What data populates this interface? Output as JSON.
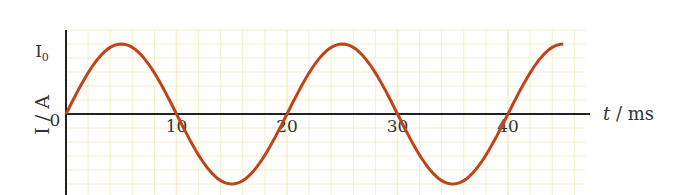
{
  "chart_data": {
    "type": "line",
    "title": "",
    "xlabel": "t / ms",
    "xlabel_italic_part": "t",
    "xlabel_unit_part": " / ms",
    "ylabel": "I / A",
    "x_ticks": [
      10,
      20,
      30,
      40
    ],
    "y_ticks": [
      {
        "value": 0,
        "label": "0"
      },
      {
        "value": 1,
        "label": "I",
        "subscript": "0"
      }
    ],
    "xlim": [
      0,
      47
    ],
    "ylim": [
      -1.05,
      1.4
    ],
    "grid": true,
    "legend": null,
    "series": [
      {
        "name": "I(t) = I0 sin(2πt/20)",
        "color": "#c0441a",
        "period_ms": 20,
        "amplitude": "I0",
        "x": [
          0,
          2.5,
          5,
          7.5,
          10,
          12.5,
          15,
          17.5,
          20,
          22.5,
          25,
          27.5,
          30,
          32.5,
          35,
          37.5,
          40,
          42.5,
          45
        ],
        "y": [
          0,
          0.71,
          1,
          0.71,
          0,
          -0.71,
          -1,
          -0.71,
          0,
          0.71,
          1,
          0.71,
          0,
          -0.71,
          -1,
          -0.71,
          0,
          0.71,
          1
        ]
      }
    ],
    "colors": {
      "axis": "#222222",
      "grid": "#f3f0c8",
      "curve": "#c0441a",
      "text": "#333333"
    }
  }
}
